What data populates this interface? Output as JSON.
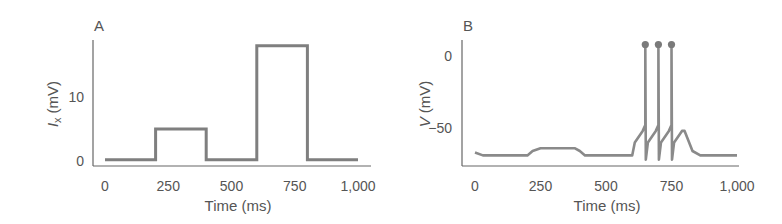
{
  "chart_data": [
    {
      "panel": "A",
      "type": "line",
      "title": "",
      "xlabel": "Time (ms)",
      "ylabel": "I_x (mV)",
      "ylabel_main": "I",
      "ylabel_sub": "x",
      "ylabel_unit": "(mV)",
      "xticks": [
        0,
        250,
        500,
        750,
        1000
      ],
      "xtick_labels": [
        "0",
        "250",
        "500",
        "750",
        "1,000"
      ],
      "yticks": [
        0,
        10
      ],
      "ytick_labels": [
        "0",
        "10"
      ],
      "xlim": [
        0,
        1000
      ],
      "ylim": [
        0,
        18
      ],
      "grid": false,
      "series": [
        {
          "name": "injected current",
          "x": [
            0,
            200,
            200,
            400,
            400,
            600,
            600,
            800,
            800,
            1000
          ],
          "y": [
            0.2,
            0.2,
            5,
            5,
            0.2,
            0.2,
            18,
            18,
            0.2,
            0.2
          ]
        }
      ]
    },
    {
      "panel": "B",
      "type": "line",
      "title": "",
      "xlabel": "Time (ms)",
      "ylabel": "V (mV)",
      "ylabel_main": "V",
      "ylabel_unit": "(mV)",
      "xticks": [
        0,
        250,
        500,
        750,
        1000
      ],
      "xtick_labels": [
        "0",
        "250",
        "500",
        "750",
        "1,000"
      ],
      "yticks": [
        0,
        -50
      ],
      "ytick_labels": [
        "0",
        "−50"
      ],
      "xlim": [
        0,
        1000
      ],
      "ylim": [
        -75,
        10
      ],
      "grid": false,
      "series": [
        {
          "name": "membrane potential",
          "x": [
            0,
            30,
            200,
            220,
            250,
            380,
            400,
            420,
            600,
            610,
            640,
            650,
            650,
            652,
            660,
            690,
            700,
            700,
            702,
            710,
            740,
            750,
            750,
            752,
            760,
            790,
            800,
            830,
            860,
            1000
          ],
          "y": [
            -67,
            -69,
            -69,
            -66,
            -64,
            -64,
            -66,
            -69,
            -69,
            -60,
            -52,
            -48,
            8,
            -72,
            -60,
            -52,
            -48,
            8,
            -72,
            -60,
            -52,
            -48,
            8,
            -72,
            -60,
            -52,
            -52,
            -66,
            -69,
            -69
          ]
        }
      ],
      "spikes_ms": [
        650,
        700,
        750
      ],
      "spike_markers": "filled circles at peaks"
    }
  ]
}
